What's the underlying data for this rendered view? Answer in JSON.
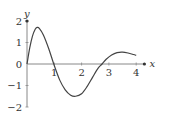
{
  "chart_data": {
    "type": "line",
    "title": "",
    "xlabel": "x",
    "ylabel": "y",
    "xlim": [
      0,
      4.3
    ],
    "ylim": [
      -2,
      2
    ],
    "grid": false,
    "legend": null,
    "x_ticks": [
      1,
      2,
      3,
      4
    ],
    "x_tick_labels": [
      "1",
      "2",
      "3",
      "4"
    ],
    "y_ticks": [
      2,
      1,
      0,
      -1,
      -2
    ],
    "y_tick_labels": [
      "2",
      "1",
      "0",
      "−1",
      "−2"
    ],
    "series": [
      {
        "name": "curve",
        "color": "#444444",
        "x": [
          0,
          0.1,
          0.2,
          0.3,
          0.37,
          0.45,
          0.6,
          0.8,
          0.98,
          1.2,
          1.4,
          1.6,
          1.78,
          2.0,
          2.2,
          2.4,
          2.6,
          2.75,
          2.9,
          3.1,
          3.3,
          3.5,
          3.7,
          3.9,
          4.0
        ],
        "y": [
          0,
          0.75,
          1.3,
          1.62,
          1.7,
          1.66,
          1.35,
          0.7,
          0,
          -0.75,
          -1.2,
          -1.45,
          -1.5,
          -1.38,
          -1.05,
          -0.62,
          -0.2,
          0,
          0.22,
          0.42,
          0.53,
          0.55,
          0.51,
          0.44,
          0.4
        ]
      }
    ]
  },
  "axes": {
    "x_label": "x",
    "y_label": "y"
  }
}
